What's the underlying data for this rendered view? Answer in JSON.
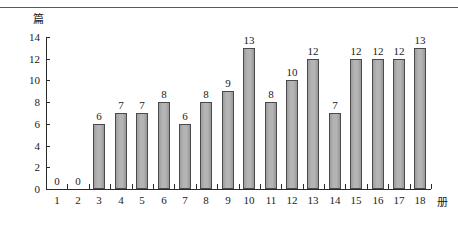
{
  "chart_data": {
    "type": "bar",
    "title": "",
    "subtitle": "",
    "xlabel": "册",
    "ylabel": "篇",
    "categories": [
      "1",
      "2",
      "3",
      "4",
      "5",
      "6",
      "7",
      "8",
      "9",
      "10",
      "11",
      "12",
      "13",
      "14",
      "15",
      "16",
      "17",
      "18"
    ],
    "values": [
      0,
      0,
      6,
      7,
      7,
      8,
      6,
      8,
      9,
      13,
      8,
      10,
      12,
      7,
      12,
      12,
      12,
      13
    ],
    "value_labels": [
      "0",
      "0",
      "6",
      "7",
      "7",
      "8",
      "6",
      "8",
      "9",
      "13",
      "8",
      "10",
      "12",
      "7",
      "12",
      "12",
      "12",
      "13"
    ],
    "ylim": [
      0,
      14
    ],
    "y_ticks": [
      0,
      2,
      4,
      6,
      8,
      10,
      12,
      14
    ],
    "y_tick_labels": [
      "0",
      "2",
      "4",
      "6",
      "8",
      "10",
      "12",
      "14"
    ],
    "grid": false,
    "legend": null,
    "legend_position": "none",
    "bar_color": "#a9a9a9",
    "bar_border_color": "#4a4a4a",
    "axis_color": "#2b2b2b",
    "text_color": "#1a1a1a",
    "annotations": []
  }
}
